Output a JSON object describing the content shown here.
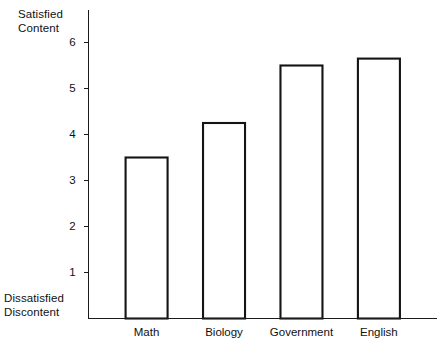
{
  "chart_data": {
    "type": "bar",
    "title": "",
    "xlabel": "",
    "ylabel": "",
    "categories": [
      "Math",
      "Biology",
      "Government",
      "English"
    ],
    "values": [
      3.5,
      4.25,
      5.5,
      5.65
    ],
    "ylim": [
      0,
      7
    ],
    "yticks": [
      1,
      2,
      3,
      4,
      5,
      6,
      7
    ],
    "ytick_labels": [
      "1",
      "2",
      "3",
      "4",
      "5",
      "6",
      "7"
    ],
    "grid": false,
    "legend": null,
    "axis_top_label": {
      "line1": "Satisfied",
      "line2": "Content"
    },
    "axis_bottom_label": {
      "line1": "Dissatisfied",
      "line2": "Discontent"
    },
    "bar_style": {
      "fill": "#ffffff",
      "stroke": "#141414"
    }
  }
}
